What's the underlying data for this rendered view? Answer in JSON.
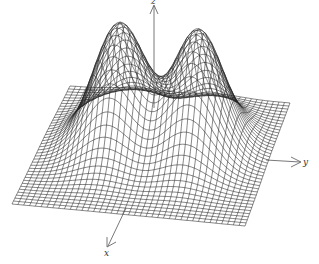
{
  "chart_data": {
    "type": "surface-wireframe",
    "title": "",
    "axes": {
      "x": {
        "label": "x"
      },
      "y": {
        "label": "y"
      },
      "z": {
        "label": "z"
      }
    },
    "surface": {
      "grid_u": 40,
      "grid_v": 40,
      "domain": {
        "u": [
          -1,
          1
        ],
        "v": [
          -1,
          1
        ]
      },
      "peaks": [
        {
          "u": -0.35,
          "v": -0.15,
          "height": 1.0,
          "sigma_u": 0.22,
          "sigma_v": 0.32
        },
        {
          "u": 0.35,
          "v": -0.15,
          "height": 1.0,
          "sigma_u": 0.22,
          "sigma_v": 0.32
        }
      ],
      "line_color": "#222222"
    },
    "grid": false,
    "legend": null
  }
}
